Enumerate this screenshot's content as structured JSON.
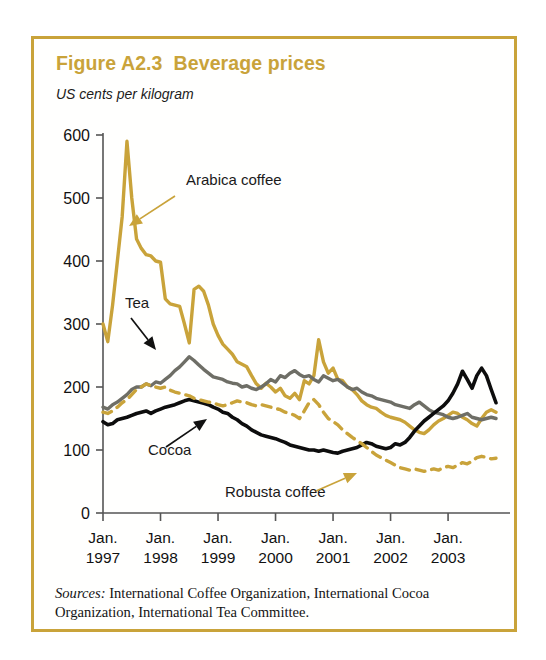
{
  "figure": {
    "title": "Figure A2.3  Beverage prices",
    "subtitle": "US cents per kilogram",
    "border_color": "#C9A33A",
    "title_color": "#C9A33A"
  },
  "source": {
    "lead": "Sources:",
    "text": " International Coffee Organization, International Cocoa Organization, International Tea Committee."
  },
  "chart_data": {
    "type": "line",
    "title": "Figure A2.3  Beverage prices",
    "subtitle": "US cents per kilogram",
    "xlabel": "",
    "ylabel": "US cents per kilogram",
    "ylim": [
      0,
      600
    ],
    "yticks": [
      0,
      100,
      200,
      300,
      400,
      500,
      600
    ],
    "ytick_labels": [
      "0",
      "100",
      "200",
      "300",
      "400",
      "500",
      "600"
    ],
    "grid": false,
    "legend_position": "inline-annotations",
    "x_tick_labels": [
      {
        "line1": "Jan.",
        "line2": "1997"
      },
      {
        "line1": "Jan.",
        "line2": "1998"
      },
      {
        "line1": "Jan.",
        "line2": "1999"
      },
      {
        "line1": "Jan.",
        "line2": "2000"
      },
      {
        "line1": "Jan.",
        "line2": "2001"
      },
      {
        "line1": "Jan.",
        "line2": "2002"
      },
      {
        "line1": "Jan.",
        "line2": "2003"
      }
    ],
    "x_start": "1997-01",
    "x_end": "2003-10",
    "x_unit": "month",
    "annotations": [
      {
        "label": "Arabica coffee",
        "color": "#C9A33A",
        "arrow": "down-left"
      },
      {
        "label": "Tea",
        "color": "#111111",
        "arrow": "down-right"
      },
      {
        "label": "Cocoa",
        "color": "#111111",
        "arrow": "up-right"
      },
      {
        "label": "Robusta coffee",
        "color": "#C9A33A",
        "arrow": "up-right"
      }
    ],
    "series": [
      {
        "name": "Arabica coffee",
        "color": "#C9A33A",
        "style": "solid",
        "values": [
          300,
          272,
          330,
          400,
          470,
          590,
          500,
          435,
          420,
          410,
          408,
          400,
          398,
          340,
          332,
          330,
          328,
          300,
          270,
          355,
          360,
          352,
          330,
          300,
          282,
          268,
          260,
          252,
          240,
          236,
          232,
          218,
          205,
          198,
          206,
          200,
          192,
          198,
          186,
          182,
          190,
          180,
          210,
          205,
          218,
          275,
          240,
          222,
          230,
          212,
          210,
          200,
          196,
          188,
          178,
          172,
          168,
          166,
          160,
          155,
          152,
          150,
          148,
          144,
          138,
          132,
          128,
          126,
          132,
          140,
          146,
          150,
          155,
          160,
          158,
          152,
          148,
          142,
          138,
          150,
          160,
          164,
          160
        ]
      },
      {
        "name": "Tea",
        "color": "#6E6E66",
        "style": "solid",
        "values": [
          168,
          165,
          172,
          176,
          182,
          188,
          196,
          200,
          200,
          205,
          202,
          208,
          206,
          212,
          218,
          226,
          232,
          240,
          248,
          242,
          235,
          228,
          222,
          216,
          214,
          212,
          208,
          206,
          205,
          200,
          202,
          198,
          196,
          200,
          205,
          212,
          208,
          218,
          215,
          222,
          226,
          220,
          216,
          218,
          212,
          208,
          218,
          214,
          210,
          212,
          206,
          200,
          196,
          198,
          192,
          188,
          186,
          182,
          180,
          178,
          176,
          172,
          170,
          168,
          166,
          172,
          176,
          170,
          164,
          160,
          158,
          156,
          152,
          150,
          152,
          155,
          158,
          152,
          150,
          148,
          150,
          152,
          150
        ]
      },
      {
        "name": "Cocoa",
        "color": "#0D0D0D",
        "style": "solid",
        "values": [
          145,
          140,
          142,
          148,
          150,
          152,
          155,
          158,
          160,
          162,
          158,
          162,
          165,
          168,
          170,
          172,
          175,
          178,
          180,
          178,
          176,
          174,
          172,
          168,
          165,
          160,
          158,
          152,
          148,
          142,
          138,
          132,
          128,
          124,
          122,
          120,
          118,
          115,
          112,
          108,
          106,
          104,
          102,
          100,
          100,
          98,
          100,
          98,
          96,
          95,
          98,
          100,
          102,
          104,
          108,
          112,
          110,
          106,
          104,
          102,
          104,
          110,
          108,
          112,
          120,
          130,
          138,
          146,
          152,
          158,
          164,
          170,
          178,
          190,
          205,
          225,
          212,
          198,
          218,
          230,
          218,
          196,
          175
        ]
      },
      {
        "name": "Robusta coffee",
        "color": "#C9A33A",
        "style": "dashed",
        "values": [
          160,
          158,
          162,
          168,
          175,
          180,
          188,
          196,
          200,
          205,
          202,
          200,
          198,
          200,
          195,
          192,
          190,
          188,
          186,
          182,
          180,
          178,
          176,
          175,
          172,
          170,
          172,
          175,
          178,
          176,
          175,
          172,
          170,
          172,
          170,
          168,
          166,
          164,
          160,
          158,
          155,
          150,
          162,
          175,
          180,
          172,
          160,
          150,
          145,
          140,
          132,
          126,
          120,
          115,
          110,
          104,
          98,
          92,
          88,
          84,
          80,
          76,
          72,
          70,
          68,
          70,
          68,
          66,
          68,
          70,
          68,
          72,
          74,
          72,
          76,
          80,
          78,
          82,
          88,
          90,
          88,
          86,
          87
        ]
      }
    ]
  }
}
